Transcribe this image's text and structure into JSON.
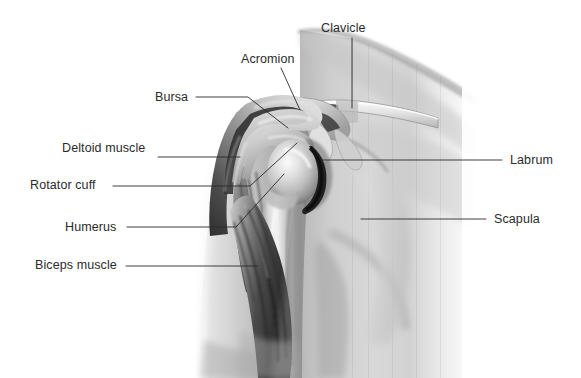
{
  "figure": {
    "type": "anatomical-illustration",
    "style": "grayscale-medical-illustration",
    "background_color": "#ffffff",
    "label_color": "#2b2b2b",
    "leader_line_color": "#2b2b2b",
    "palette": {
      "skin_light": "#e9e9e9",
      "skin_mid": "#c9c9c9",
      "skin_shadow": "#9b9b9b",
      "muscle_dark": "#4a4a4a",
      "muscle_darkest": "#2e2e2e",
      "bone_light": "#f2f2f2",
      "bone_mid": "#d6d6d6",
      "labrum_dark": "#1f1f1f"
    }
  },
  "labels": [
    {
      "id": "clavicle",
      "text": "Clavicle",
      "side": "top",
      "x": 321,
      "y": 22
    },
    {
      "id": "acromion",
      "text": "Acromion",
      "side": "left",
      "x": 241,
      "y": 53
    },
    {
      "id": "bursa",
      "text": "Bursa",
      "side": "left",
      "x": 155,
      "y": 91
    },
    {
      "id": "deltoid-muscle",
      "text": "Deltoid muscle",
      "side": "left",
      "x": 62,
      "y": 142
    },
    {
      "id": "rotator-cuff",
      "text": "Rotator cuff",
      "side": "left",
      "x": 30,
      "y": 179
    },
    {
      "id": "humerus",
      "text": "Humerus",
      "side": "left",
      "x": 65,
      "y": 221
    },
    {
      "id": "biceps-muscle",
      "text": "Biceps muscle",
      "side": "left",
      "x": 35,
      "y": 259
    },
    {
      "id": "labrum",
      "text": "Labrum",
      "side": "right",
      "x": 510,
      "y": 154
    },
    {
      "id": "scapula",
      "text": "Scapula",
      "side": "right",
      "x": 494,
      "y": 213
    }
  ],
  "leader_lines": [
    {
      "id": "clavicle-leader",
      "points": "352,38 352,108"
    },
    {
      "id": "acromion-leader",
      "points": "281,68 300,108"
    },
    {
      "id": "bursa-leader",
      "points": "196,97 248,97 287,128"
    },
    {
      "id": "deltoid-leader",
      "points": "158,157 238,157"
    },
    {
      "id": "rotator-cuff-leader",
      "points": "113,186 250,186 296,143"
    },
    {
      "id": "humerus-leader",
      "points": "127,227 236,227 283,173"
    },
    {
      "id": "biceps-leader",
      "points": "126,266 256,266"
    },
    {
      "id": "labrum-leader",
      "points": "321,160 502,160"
    },
    {
      "id": "scapula-leader",
      "points": "361,219 486,219"
    }
  ],
  "anatomy_parts": [
    {
      "id": "torso",
      "name": "Torso and neck silhouette"
    },
    {
      "id": "upper-arm",
      "name": "Upper arm"
    },
    {
      "id": "clavicle-bone",
      "name": "Clavicle bone"
    },
    {
      "id": "acromion-bone",
      "name": "Acromion process"
    },
    {
      "id": "humeral-head",
      "name": "Humeral head (ball of humerus)"
    },
    {
      "id": "glenoid-labrum",
      "name": "Glenoid labrum rim"
    },
    {
      "id": "scapula-bone",
      "name": "Scapula"
    },
    {
      "id": "deltoid",
      "name": "Deltoid muscle band"
    },
    {
      "id": "biceps",
      "name": "Biceps muscle belly"
    },
    {
      "id": "rotator-cuff-t",
      "name": "Rotator cuff tendon"
    },
    {
      "id": "bursa-sac",
      "name": "Subacromial bursa"
    }
  ]
}
